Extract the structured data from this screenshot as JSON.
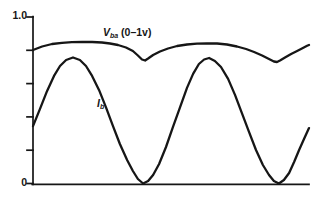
{
  "figure": {
    "background": "#ffffff",
    "line_color": "#161616"
  },
  "chart_data": {
    "type": "line",
    "title": "",
    "xlabel": "",
    "ylabel": "",
    "ylim": [
      0,
      1.0
    ],
    "xlim_norm": [
      0,
      100
    ],
    "grid": false,
    "legend_position": "inline-annotations",
    "yticks": [
      0,
      0.2,
      0.4,
      0.6,
      0.8,
      1.0
    ],
    "y_top_label": "1.0",
    "y_bottom_label": "0",
    "layout_px": {
      "axis_x": 33,
      "axis_top": 17,
      "axis_bottom": 183.5,
      "axis_right": 309,
      "tick_len": 6,
      "axis_stroke": 1.7,
      "curve_stroke": 2.3
    },
    "series": [
      {
        "name": "vba",
        "label": {
          "symbol": "V",
          "subscript": "ba",
          "suffix": " (0–1v)"
        },
        "description": "Slowly undulating voltage near 0.85 with sharp dips to ~0.73 aligned with Ib zeros",
        "points": [
          [
            0.0,
            0.802
          ],
          [
            3.3,
            0.823
          ],
          [
            6.9,
            0.838
          ],
          [
            10.5,
            0.845
          ],
          [
            14.1,
            0.849
          ],
          [
            17.8,
            0.85
          ],
          [
            21.4,
            0.85
          ],
          [
            25.0,
            0.847
          ],
          [
            27.9,
            0.841
          ],
          [
            30.8,
            0.832
          ],
          [
            33.7,
            0.817
          ],
          [
            36.2,
            0.796
          ],
          [
            38.0,
            0.769
          ],
          [
            39.5,
            0.745
          ],
          [
            40.6,
            0.739
          ],
          [
            41.7,
            0.751
          ],
          [
            43.5,
            0.772
          ],
          [
            46.0,
            0.793
          ],
          [
            48.9,
            0.811
          ],
          [
            52.2,
            0.826
          ],
          [
            55.8,
            0.835
          ],
          [
            59.4,
            0.84
          ],
          [
            63.0,
            0.842
          ],
          [
            66.7,
            0.841
          ],
          [
            70.3,
            0.835
          ],
          [
            73.9,
            0.823
          ],
          [
            77.2,
            0.808
          ],
          [
            80.1,
            0.79
          ],
          [
            83.0,
            0.769
          ],
          [
            85.5,
            0.748
          ],
          [
            87.3,
            0.733
          ],
          [
            88.4,
            0.73
          ],
          [
            89.5,
            0.739
          ],
          [
            91.3,
            0.757
          ],
          [
            93.5,
            0.778
          ],
          [
            95.7,
            0.796
          ],
          [
            97.8,
            0.814
          ],
          [
            99.3,
            0.827
          ],
          [
            100.0,
            0.832
          ]
        ]
      },
      {
        "name": "ib",
        "label": {
          "symbol": "I",
          "subscript": "b",
          "suffix": ""
        },
        "description": "Rectified-sine-like current: peaks ~0.75, touches 0 between peaks",
        "points": [
          [
            0.0,
            0.345
          ],
          [
            2.5,
            0.447
          ],
          [
            5.1,
            0.556
          ],
          [
            7.6,
            0.646
          ],
          [
            9.8,
            0.706
          ],
          [
            12.0,
            0.742
          ],
          [
            14.5,
            0.757
          ],
          [
            17.0,
            0.742
          ],
          [
            19.2,
            0.706
          ],
          [
            21.4,
            0.646
          ],
          [
            23.9,
            0.562
          ],
          [
            26.4,
            0.459
          ],
          [
            29.0,
            0.345
          ],
          [
            31.5,
            0.237
          ],
          [
            34.1,
            0.141
          ],
          [
            36.2,
            0.075
          ],
          [
            38.0,
            0.027
          ],
          [
            39.9,
            0.0
          ],
          [
            41.7,
            0.015
          ],
          [
            43.5,
            0.051
          ],
          [
            45.7,
            0.117
          ],
          [
            48.2,
            0.219
          ],
          [
            50.7,
            0.339
          ],
          [
            53.3,
            0.459
          ],
          [
            55.8,
            0.574
          ],
          [
            58.0,
            0.658
          ],
          [
            60.1,
            0.718
          ],
          [
            62.0,
            0.745
          ],
          [
            63.8,
            0.754
          ],
          [
            65.9,
            0.736
          ],
          [
            68.1,
            0.7
          ],
          [
            70.7,
            0.628
          ],
          [
            73.2,
            0.532
          ],
          [
            75.7,
            0.423
          ],
          [
            78.3,
            0.309
          ],
          [
            80.8,
            0.201
          ],
          [
            83.3,
            0.111
          ],
          [
            85.5,
            0.051
          ],
          [
            87.3,
            0.015
          ],
          [
            89.1,
            0.0
          ],
          [
            90.9,
            0.021
          ],
          [
            92.8,
            0.063
          ],
          [
            94.6,
            0.129
          ],
          [
            96.4,
            0.201
          ],
          [
            98.2,
            0.267
          ],
          [
            100.0,
            0.333
          ]
        ]
      }
    ]
  }
}
